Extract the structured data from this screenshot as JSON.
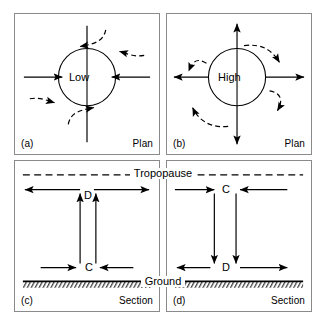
{
  "figure": {
    "kind": "meteorology-convergence-divergence-diagram",
    "panel_count": 4
  },
  "panels": [
    {
      "id": "a",
      "tag": "(a)",
      "view": "Plan",
      "center_label": "Low",
      "system": "low-pressure",
      "horizontal_arrows": "inward",
      "curved_arrows": "cyclonic-inflow",
      "description": "Plan view of a low pressure centre with converging inflow"
    },
    {
      "id": "b",
      "tag": "(b)",
      "view": "Plan",
      "center_label": "High",
      "system": "high-pressure",
      "horizontal_arrows": "outward",
      "curved_arrows": "anticyclonic-outflow",
      "description": "Plan view of a high pressure centre with diverging outflow"
    },
    {
      "id": "c",
      "tag": "(c)",
      "view": "Section",
      "top_boundary_label": "Tropopause",
      "bottom_boundary_label": "Ground",
      "top_label": "D",
      "bottom_label": "C",
      "vertical_flow": "up",
      "top_flow": "divergence",
      "bottom_flow": "convergence",
      "description": "Section through a low: convergence at ground, ascent, divergence at tropopause"
    },
    {
      "id": "d",
      "tag": "(d)",
      "view": "Section",
      "top_boundary_label": "Tropopause",
      "bottom_boundary_label": "Ground",
      "top_label": "C",
      "bottom_label": "D",
      "vertical_flow": "down",
      "top_flow": "convergence",
      "bottom_flow": "divergence",
      "description": "Section through a high: convergence at tropopause, descent, divergence at ground"
    }
  ],
  "legend": {
    "C": "Convergence",
    "D": "Divergence"
  },
  "colors": {
    "line": "#000000",
    "frame": "#8a8a8a",
    "background": "#ffffff"
  }
}
